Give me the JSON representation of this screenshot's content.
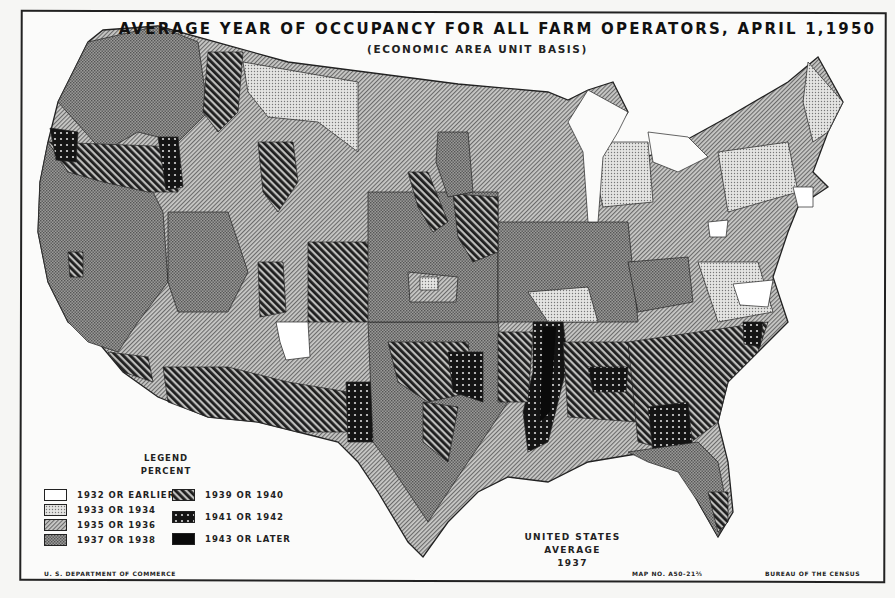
{
  "map": {
    "title": "AVERAGE YEAR OF OCCUPANCY FOR ALL FARM OPERATORS, APRIL 1,1950",
    "subtitle": "(ECONOMIC AREA UNIT BASIS)",
    "region": "United States (conterminous)",
    "us_average_label": "UNITED STATES AVERAGE",
    "us_average_value": "1937"
  },
  "legend": {
    "title": "LEGEND",
    "subtitle": "PERCENT",
    "items": [
      {
        "label": "1932 OR EARLIER",
        "pattern": "blank",
        "fill": "#ffffff"
      },
      {
        "label": "1933 OR 1934",
        "pattern": "fine-dots",
        "fill": "#d6d6d6"
      },
      {
        "label": "1935 OR 1936",
        "pattern": "fine-diagonal",
        "fill": "#a8a8a8"
      },
      {
        "label": "1937 OR 1938",
        "pattern": "crosshatch",
        "fill": "#8c8c8c"
      },
      {
        "label": "1939 OR 1940",
        "pattern": "bold-diagonal",
        "fill": "#4a4a4a"
      },
      {
        "label": "1941 OR 1942",
        "pattern": "dark-dotted",
        "fill": "#222222"
      },
      {
        "label": "1943 OR LATER",
        "pattern": "solid-black",
        "fill": "#0a0a0a"
      }
    ]
  },
  "footer": {
    "left": "U. S. DEPARTMENT OF COMMERCE",
    "map_number": "MAP NO. A50-21⅔",
    "right": "BUREAU OF THE CENSUS"
  }
}
